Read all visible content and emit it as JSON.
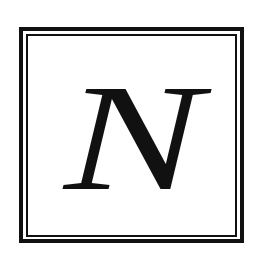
{
  "logo": {
    "letter": "N",
    "style": "italic serif",
    "color": "#111111",
    "background": "#ffffff",
    "frame": {
      "type": "double-line square border",
      "outer_line_color": "#111111",
      "inner_line_color": "#111111"
    }
  }
}
